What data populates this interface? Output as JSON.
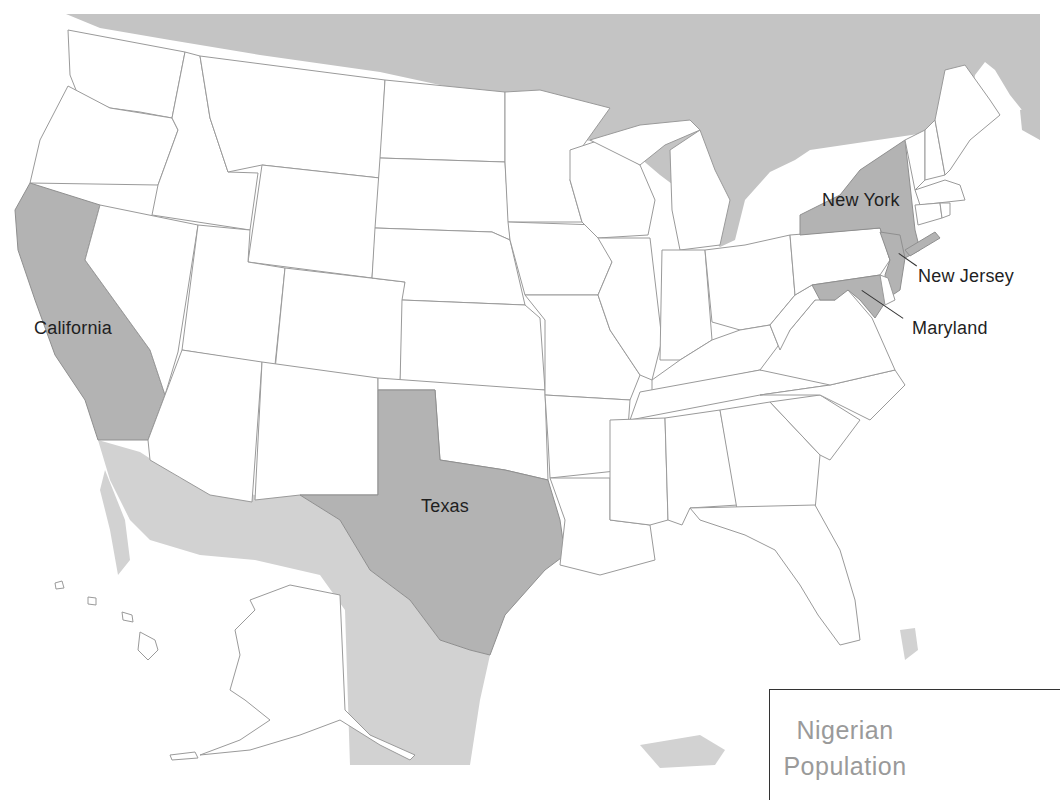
{
  "map": {
    "title_lines": [
      "Nigerian",
      "Population"
    ],
    "highlight_color": "#b3b3b3",
    "foreign_land_color": "#c4c4c4",
    "border_color": "#9a9a9a",
    "highlighted_states": [
      {
        "name": "California",
        "label": "California"
      },
      {
        "name": "Texas",
        "label": "Texas"
      },
      {
        "name": "New York",
        "label": "New York"
      },
      {
        "name": "New Jersey",
        "label": "New Jersey"
      },
      {
        "name": "Maryland",
        "label": "Maryland"
      }
    ]
  }
}
